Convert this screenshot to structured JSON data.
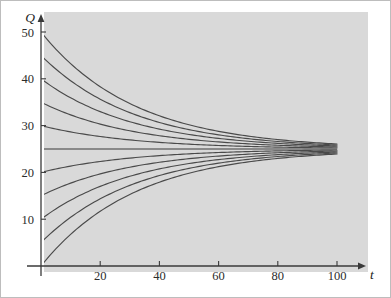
{
  "figure": {
    "panel_color": "#d9d9d9",
    "page_color": "#ffffff",
    "axis_color": "#3a3a3a",
    "curve_color": "#4a4a4a",
    "equilibrium_color": "#6e6e6e",
    "border_color": "#bdbdbd"
  },
  "chart_data": {
    "type": "line",
    "title": "",
    "subtitle": "",
    "xlabel": "t",
    "ylabel": "Q",
    "xlim": [
      0,
      112
    ],
    "ylim": [
      0,
      54
    ],
    "xticks": [
      20,
      40,
      60,
      80,
      100
    ],
    "yticks": [
      10,
      20,
      30,
      40,
      50
    ],
    "xtick_labels": [
      "20",
      "40",
      "60",
      "80",
      "100"
    ],
    "ytick_labels": [
      "10",
      "20",
      "30",
      "40",
      "50"
    ],
    "grid": false,
    "legend": false,
    "legend_position": "none",
    "equilibrium": 25,
    "equilibrium_label": "Q = 25",
    "decay_rate": 0.0315,
    "x_end": 100,
    "annotations": [
      "Solution curves of dQ/dt = -k(Q - 25) approaching the equilibrium Q = 25",
      "Curves are drawn from t = 0 to t = 100"
    ],
    "series": [
      {
        "name": "Q0 = 50",
        "initial_value": 50,
        "x": [
          0,
          10,
          20,
          30,
          40,
          50,
          60,
          70,
          80,
          90,
          100
        ],
        "values": [
          50.0,
          43.3,
          38.3,
          34.7,
          32.1,
          30.2,
          28.8,
          27.8,
          27.1,
          26.6,
          26.1
        ]
      },
      {
        "name": "Q0 = 45",
        "initial_value": 45,
        "x": [
          0,
          10,
          20,
          30,
          40,
          50,
          60,
          70,
          80,
          90,
          100
        ],
        "values": [
          45.0,
          39.6,
          35.7,
          32.8,
          30.7,
          29.2,
          28.1,
          27.2,
          26.7,
          26.3,
          25.9
        ]
      },
      {
        "name": "Q0 = 40",
        "initial_value": 40,
        "x": [
          0,
          10,
          20,
          30,
          40,
          50,
          60,
          70,
          80,
          90,
          100
        ],
        "values": [
          40.0,
          35.9,
          33.0,
          30.8,
          29.2,
          28.1,
          27.3,
          26.7,
          26.3,
          26.0,
          25.7
        ]
      },
      {
        "name": "Q0 = 35",
        "initial_value": 35,
        "x": [
          0,
          10,
          20,
          30,
          40,
          50,
          60,
          70,
          80,
          90,
          100
        ],
        "values": [
          35.0,
          32.3,
          30.3,
          28.9,
          27.8,
          27.1,
          26.5,
          26.1,
          25.8,
          25.6,
          25.5
        ]
      },
      {
        "name": "Q0 = 30",
        "initial_value": 30,
        "x": [
          0,
          10,
          20,
          30,
          40,
          50,
          60,
          70,
          80,
          90,
          100
        ],
        "values": [
          30.0,
          28.6,
          27.7,
          26.9,
          26.4,
          26.0,
          25.8,
          25.6,
          25.4,
          25.3,
          25.2
        ]
      },
      {
        "name": "Q0 = 25 (equilibrium)",
        "initial_value": 25,
        "x": [
          0,
          100
        ],
        "values": [
          25.0,
          25.0
        ]
      },
      {
        "name": "Q0 = 20",
        "initial_value": 20,
        "x": [
          0,
          10,
          20,
          30,
          40,
          50,
          60,
          70,
          80,
          90,
          100
        ],
        "values": [
          20.0,
          21.4,
          22.3,
          23.1,
          23.6,
          24.0,
          24.2,
          24.4,
          24.6,
          24.7,
          24.8
        ]
      },
      {
        "name": "Q0 = 15",
        "initial_value": 15,
        "x": [
          0,
          10,
          20,
          30,
          40,
          50,
          60,
          70,
          80,
          90,
          100
        ],
        "values": [
          15.0,
          17.7,
          19.7,
          21.1,
          22.2,
          22.9,
          23.5,
          23.9,
          24.2,
          24.4,
          24.6
        ]
      },
      {
        "name": "Q0 = 10",
        "initial_value": 10,
        "x": [
          0,
          10,
          20,
          30,
          40,
          50,
          60,
          70,
          80,
          90,
          100
        ],
        "values": [
          10.0,
          14.1,
          17.0,
          19.2,
          20.8,
          21.9,
          22.7,
          23.3,
          23.7,
          24.0,
          24.3
        ]
      },
      {
        "name": "Q0 = 5",
        "initial_value": 5,
        "x": [
          0,
          10,
          20,
          30,
          40,
          50,
          60,
          70,
          80,
          90,
          100
        ],
        "values": [
          5.0,
          10.4,
          14.3,
          17.2,
          19.3,
          20.8,
          22.0,
          22.8,
          23.4,
          23.8,
          24.1
        ]
      },
      {
        "name": "Q0 = 0",
        "initial_value": 0,
        "x": [
          0,
          10,
          20,
          30,
          40,
          50,
          60,
          70,
          80,
          90,
          100
        ],
        "values": [
          0.0,
          6.7,
          11.7,
          15.3,
          17.9,
          19.8,
          21.2,
          22.2,
          22.9,
          23.4,
          23.9
        ]
      }
    ]
  }
}
